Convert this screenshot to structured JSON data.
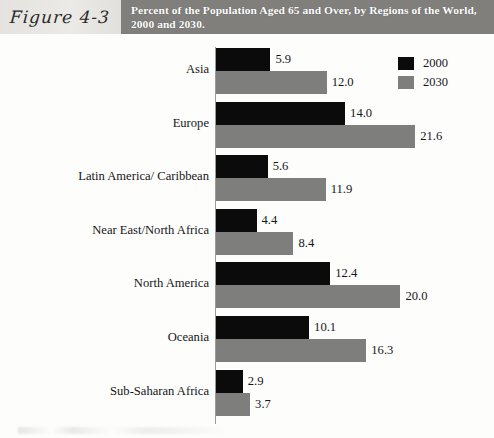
{
  "header": {
    "figure_number": "Figure 4-3",
    "title": "Percent of the Population Aged 65 and Over, by Regions of the World, 2000 and 2030."
  },
  "legend": {
    "items": [
      {
        "label": "2000",
        "color": "#0b0b0b"
      },
      {
        "label": "2030",
        "color": "#7e7e7c"
      }
    ]
  },
  "colors": {
    "series_2000": "#0b0b0b",
    "series_2030": "#7e7e7c",
    "title_band": "#807f7c",
    "figure_box": "#e7e5e1",
    "axis": "#9a9a98"
  },
  "chart_data": {
    "type": "bar",
    "orientation": "horizontal",
    "title": "Percent of the Population Aged 65 and Over, by Regions of the World, 2000 and 2030.",
    "xlabel": "",
    "ylabel": "",
    "xlim": [
      0,
      21.6
    ],
    "grid": false,
    "legend_position": "top-right",
    "categories": [
      "Asia",
      "Europe",
      "Latin America/ Caribbean",
      "Near East/North Africa",
      "North America",
      "Oceania",
      "Sub-Saharan Africa"
    ],
    "series": [
      {
        "name": "2000",
        "color": "#0b0b0b",
        "values": [
          5.9,
          14.0,
          5.6,
          4.4,
          12.4,
          10.1,
          2.9
        ],
        "value_labels": [
          "5.9",
          "14.0",
          "5.6",
          "4.4",
          "12.4",
          "10.1",
          "2.9"
        ]
      },
      {
        "name": "2030",
        "color": "#7e7e7c",
        "values": [
          12.0,
          21.6,
          11.9,
          8.4,
          20.0,
          16.3,
          3.7
        ],
        "value_labels": [
          "12.0",
          "21.6",
          "11.9",
          "8.4",
          "20.0",
          "16.3",
          "3.7"
        ]
      }
    ]
  }
}
